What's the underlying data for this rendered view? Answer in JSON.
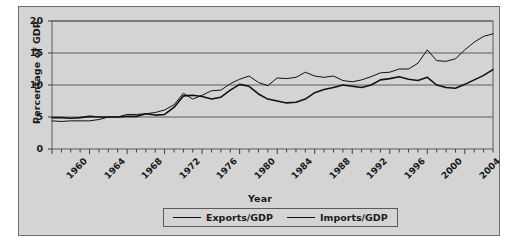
{
  "chart_data": {
    "type": "line",
    "title": "",
    "xlabel": "Year",
    "ylabel": "Percentage of GDP",
    "xlim": [
      1960,
      2007
    ],
    "ylim": [
      0,
      20
    ],
    "yticks": [
      0,
      5,
      10,
      15,
      20
    ],
    "grid": true,
    "grid_axis": "y",
    "legend_position": "bottom",
    "xtick_labels": [
      "1960",
      "1964",
      "1968",
      "1972",
      "1976",
      "1980",
      "1984",
      "1988",
      "1992",
      "1996",
      "2000",
      "2004"
    ],
    "xtick_values": [
      1960,
      1964,
      1968,
      1972,
      1976,
      1980,
      1984,
      1988,
      1992,
      1996,
      2000,
      2004
    ],
    "minor_tick_interval": 1,
    "x": [
      1960,
      1961,
      1962,
      1963,
      1964,
      1965,
      1966,
      1967,
      1968,
      1969,
      1970,
      1971,
      1972,
      1973,
      1974,
      1975,
      1976,
      1977,
      1978,
      1979,
      1980,
      1981,
      1982,
      1983,
      1984,
      1985,
      1986,
      1987,
      1988,
      1989,
      1990,
      1991,
      1992,
      1993,
      1994,
      1995,
      1996,
      1997,
      1998,
      1999,
      2000,
      2001,
      2002,
      2003,
      2004,
      2005,
      2006,
      2007
    ],
    "series": [
      {
        "name": "Exports/GDP",
        "color": "#111111",
        "linewidth": 1.6,
        "values": [
          4.9,
          4.9,
          4.8,
          4.9,
          5.1,
          5.0,
          5.0,
          5.0,
          5.1,
          5.1,
          5.5,
          5.3,
          5.4,
          6.5,
          8.3,
          8.4,
          8.2,
          7.8,
          8.1,
          9.2,
          10.1,
          9.8,
          8.6,
          7.8,
          7.5,
          7.2,
          7.3,
          7.8,
          8.8,
          9.3,
          9.6,
          10.0,
          9.8,
          9.6,
          10.0,
          10.8,
          11.0,
          11.3,
          10.9,
          10.7,
          11.2,
          10.0,
          9.6,
          9.5,
          10.1,
          10.8,
          11.5,
          12.4
        ]
      },
      {
        "name": "Imports/GDP",
        "color": "#111111",
        "linewidth": 1.0,
        "values": [
          4.4,
          4.3,
          4.4,
          4.4,
          4.4,
          4.6,
          5.0,
          5.0,
          5.4,
          5.4,
          5.5,
          5.7,
          6.1,
          6.9,
          8.7,
          7.8,
          8.4,
          9.1,
          9.2,
          10.2,
          10.9,
          11.4,
          10.4,
          9.9,
          11.1,
          11.0,
          11.2,
          12.0,
          11.4,
          11.2,
          11.4,
          10.7,
          10.5,
          10.8,
          11.3,
          11.9,
          12.0,
          12.5,
          12.5,
          13.4,
          15.5,
          13.8,
          13.7,
          14.1,
          15.5,
          16.7,
          17.6,
          18.0
        ]
      }
    ]
  },
  "legend": {
    "items": [
      {
        "label": "Exports/GDP"
      },
      {
        "label": "Imports/GDP"
      }
    ]
  }
}
